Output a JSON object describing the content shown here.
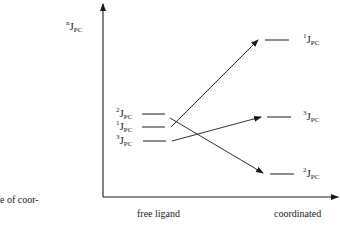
{
  "diagram": {
    "y_axis_label": {
      "sup": "n",
      "main": "J",
      "sub": "PC"
    },
    "x_axis": {
      "left_label": "free ligand",
      "right_label": "coordinated"
    },
    "caption_fragment": "e of coor-",
    "free_ligand_levels": [
      {
        "sup": "2",
        "main": "J",
        "sub": "PC",
        "order": 1
      },
      {
        "sup": "1",
        "main": "J",
        "sub": "PC",
        "order": 2
      },
      {
        "sup": "3",
        "main": "J",
        "sub": "PC",
        "order": 3
      }
    ],
    "coordinated_levels": [
      {
        "sup": "1",
        "main": "J",
        "sub": "PC",
        "order": 1
      },
      {
        "sup": "3",
        "main": "J",
        "sub": "PC",
        "order": 2
      },
      {
        "sup": "2",
        "main": "J",
        "sub": "PC",
        "order": 3
      }
    ],
    "transitions": [
      {
        "from": "1JPC free",
        "to": "1JPC coordinated"
      },
      {
        "from": "3JPC free",
        "to": "3JPC coordinated"
      },
      {
        "from": "2JPC free",
        "to": "2JPC coordinated"
      }
    ],
    "colors": {
      "line": "#1a1a1a",
      "background": "#ffffff"
    }
  }
}
